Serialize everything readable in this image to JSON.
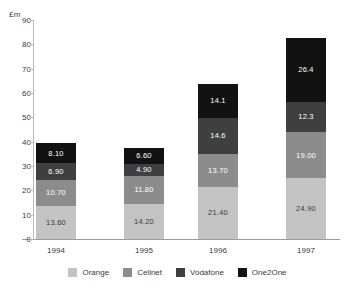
{
  "chart_data": {
    "type": "bar",
    "stacked": true,
    "title": "",
    "xlabel": "",
    "ylabel": "£m",
    "ylim": [
      0,
      90
    ],
    "ytick_step": 10,
    "yticks": [
      "0",
      "10",
      "20",
      "30",
      "40",
      "50",
      "60",
      "70",
      "80",
      "90"
    ],
    "grid": false,
    "legend_position": "bottom",
    "categories": [
      "1994",
      "1995",
      "1996",
      "1997"
    ],
    "series": [
      {
        "name": "Orange",
        "color": "#c3c3c3",
        "tone": "light",
        "values": [
          13.6,
          14.2,
          21.4,
          24.9
        ],
        "labels": [
          "13.60",
          "14.20",
          "21.40",
          "24.90"
        ]
      },
      {
        "name": "Cellnet",
        "color": "#8c8c8c",
        "tone": "mid",
        "values": [
          10.7,
          11.8,
          13.7,
          19.0
        ],
        "labels": [
          "10.70",
          "11.80",
          "13.70",
          "19.00"
        ]
      },
      {
        "name": "Vodafone",
        "color": "#3f3f3f",
        "tone": "dark",
        "values": [
          6.9,
          4.9,
          14.6,
          12.3
        ],
        "labels": [
          "6.90",
          "4.90",
          "14.6",
          "12.3"
        ]
      },
      {
        "name": "One2One",
        "color": "#121212",
        "tone": "black",
        "values": [
          8.1,
          6.6,
          14.1,
          26.4
        ],
        "labels": [
          "8.10",
          "6.60",
          "14.1",
          "26.4"
        ]
      }
    ],
    "totals": [
      39.3,
      37.5,
      63.8,
      82.6
    ]
  }
}
